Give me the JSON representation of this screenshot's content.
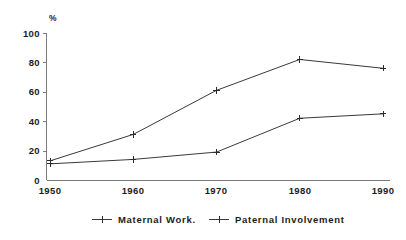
{
  "chart_data": {
    "type": "line",
    "title": "",
    "xlabel": "",
    "ylabel": "%",
    "x": [
      "1950",
      "1960",
      "1970",
      "1980",
      "1990"
    ],
    "categories": [
      "1950",
      "1960",
      "1970",
      "1980",
      "1990"
    ],
    "ylim": [
      0,
      100
    ],
    "yticks": [
      "0",
      "20",
      "40",
      "60",
      "80",
      "100"
    ],
    "xlim": [
      "1950",
      "1990"
    ],
    "grid": false,
    "legend_position": "bottom",
    "marker": "plus",
    "series": [
      {
        "name": "Maternal Work.",
        "values": [
          13,
          31,
          61,
          82,
          76
        ],
        "color": "#3a3a3a"
      },
      {
        "name": "Paternal Involvement",
        "values": [
          11,
          14,
          19,
          42,
          45
        ],
        "color": "#3a3a3a"
      }
    ]
  },
  "axis": {
    "y_unit": "%",
    "y_ticks": [
      {
        "label": "100",
        "value": 100
      },
      {
        "label": "80",
        "value": 80
      },
      {
        "label": "60",
        "value": 60
      },
      {
        "label": "40",
        "value": 40
      },
      {
        "label": "20",
        "value": 20
      },
      {
        "label": "0",
        "value": 0
      }
    ],
    "x_ticks": [
      {
        "label": "1950",
        "value": 1950
      },
      {
        "label": "1960",
        "value": 1960
      },
      {
        "label": "1970",
        "value": 1970
      },
      {
        "label": "1980",
        "value": 1980
      },
      {
        "label": "1990",
        "value": 1990
      }
    ]
  },
  "legend": {
    "items": [
      {
        "label": "Maternal Work.",
        "color": "#3a3a3a"
      },
      {
        "label": "Paternal Involvement",
        "color": "#3a3a3a"
      }
    ]
  },
  "colors": {
    "background": "#ffffff",
    "axis": "#7b7b7b",
    "line": "#3a3a3a",
    "text": "#1c1c1c"
  }
}
